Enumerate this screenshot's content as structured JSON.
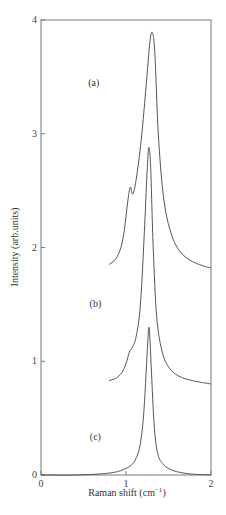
{
  "chart_data": {
    "type": "line",
    "title": "",
    "xlabel": "Raman shift (cm⁻¹)",
    "xlabel_parts": {
      "main": "Raman shift (cm",
      "sup": "−1",
      "close": ")"
    },
    "ylabel": "Intensity (arb.units)",
    "xlim": [
      0,
      2
    ],
    "ylim": [
      0,
      4
    ],
    "xticks": [
      0,
      1,
      2
    ],
    "yticks": [
      0,
      1,
      2,
      3,
      4
    ],
    "grid": false,
    "legend": "none (curves labeled inline)",
    "series": [
      {
        "name": "(a)",
        "label_pos": [
          0.62,
          3.42
        ],
        "x": [
          0.8,
          0.88,
          0.94,
          0.98,
          1.02,
          1.05,
          1.08,
          1.12,
          1.18,
          1.24,
          1.28,
          1.31,
          1.34,
          1.38,
          1.44,
          1.52,
          1.62,
          1.75,
          1.9,
          2.0
        ],
        "y": [
          1.85,
          1.9,
          2.0,
          2.15,
          2.4,
          2.53,
          2.47,
          2.6,
          2.95,
          3.45,
          3.8,
          3.89,
          3.7,
          3.0,
          2.45,
          2.15,
          1.98,
          1.89,
          1.84,
          1.82
        ]
      },
      {
        "name": "(b)",
        "label_pos": [
          0.64,
          1.48
        ],
        "x": [
          0.8,
          0.88,
          0.95,
          1.0,
          1.04,
          1.08,
          1.12,
          1.17,
          1.22,
          1.25,
          1.27,
          1.29,
          1.32,
          1.36,
          1.42,
          1.5,
          1.62,
          1.78,
          2.0
        ],
        "y": [
          0.83,
          0.85,
          0.9,
          0.98,
          1.08,
          1.13,
          1.22,
          1.5,
          2.2,
          2.7,
          2.88,
          2.7,
          2.0,
          1.4,
          1.1,
          0.95,
          0.87,
          0.83,
          0.8
        ]
      },
      {
        "name": "(c)",
        "label_pos": [
          0.64,
          0.31
        ],
        "x": [
          0.0,
          0.4,
          0.7,
          0.9,
          1.05,
          1.12,
          1.17,
          1.21,
          1.24,
          1.26,
          1.27,
          1.28,
          1.3,
          1.33,
          1.37,
          1.43,
          1.55,
          1.75,
          2.0
        ],
        "y": [
          0.0,
          0.0,
          0.01,
          0.03,
          0.08,
          0.15,
          0.28,
          0.55,
          0.95,
          1.22,
          1.3,
          1.22,
          0.9,
          0.45,
          0.2,
          0.1,
          0.04,
          0.01,
          0.0
        ]
      }
    ]
  }
}
